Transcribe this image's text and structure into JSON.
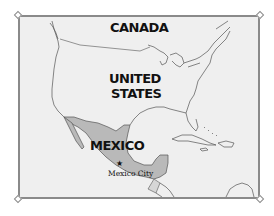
{
  "map": {
    "title": "",
    "colors": {
      "background": "#efefef",
      "frame": "#8a8a8a",
      "highlight_country": "#b9b9b9",
      "coastline": "#555555",
      "border_line": "#6a6a6a",
      "label_text": "#111111"
    },
    "countries": [
      {
        "name": "CANADA",
        "highlighted": false
      },
      {
        "name": "UNITED STATES",
        "line1": "UNITED",
        "line2": "STATES",
        "highlighted": false
      },
      {
        "name": "MEXICO",
        "highlighted": true
      }
    ],
    "cities": [
      {
        "name": "Mexico City",
        "marker": "star-icon",
        "capital": true
      }
    ],
    "labels": {
      "canada": "CANADA",
      "us_line1": "UNITED",
      "us_line2": "STATES",
      "mexico": "MEXICO",
      "mexico_city": "Mexico City",
      "star": "★"
    },
    "selection_handles": [
      "top-left",
      "top-right",
      "bottom-left",
      "bottom-right"
    ]
  }
}
